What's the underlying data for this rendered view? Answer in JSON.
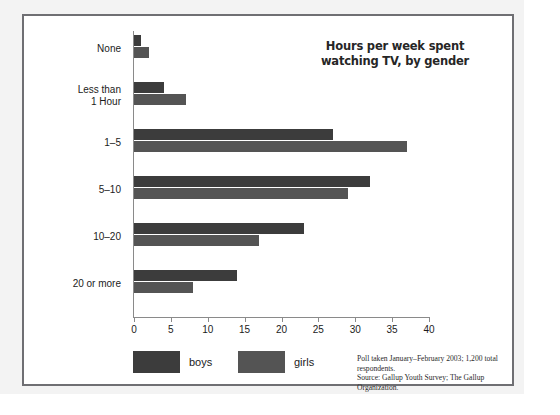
{
  "figure": {
    "title_line1": "Hours per week spent",
    "title_line2": "watching TV, by gender",
    "source_note": "Poll taken January–February 2003; 1,200 total respondents.\nSource: Gallup Youth Survey; The Gallup Organization."
  },
  "legend": {
    "boys_label": "boys",
    "girls_label": "girls"
  },
  "colors": {
    "boys": "#3c3c3c",
    "girls": "#545454",
    "frame": "#6f6f73",
    "axis": "#8a8a8a",
    "text": "#1b1b1b",
    "backdrop": "#f3f3f3"
  },
  "chart_data": {
    "type": "bar",
    "orientation": "horizontal",
    "title": "Hours per week spent watching TV, by gender",
    "xlabel": "",
    "ylabel": "",
    "xlim": [
      0,
      40
    ],
    "xticks": [
      0,
      5,
      10,
      15,
      20,
      25,
      30,
      35,
      40
    ],
    "xtick_labels": [
      "0",
      "5",
      "10",
      "15",
      "20",
      "25",
      "30",
      "35",
      "40"
    ],
    "grid": false,
    "legend_position": "bottom-left",
    "categories": [
      "None",
      "Less than\n1 Hour",
      "1–5",
      "5–10",
      "10–20",
      "20 or more"
    ],
    "series": [
      {
        "name": "boys",
        "color": "#3c3c3c",
        "values": [
          1,
          4,
          27,
          32,
          23,
          14
        ]
      },
      {
        "name": "girls",
        "color": "#545454",
        "values": [
          2,
          7,
          37,
          29,
          17,
          8
        ]
      }
    ],
    "annotations": [
      "Poll taken January–February 2003; 1,200 total respondents.",
      "Source: Gallup Youth Survey; The Gallup Organization."
    ]
  }
}
